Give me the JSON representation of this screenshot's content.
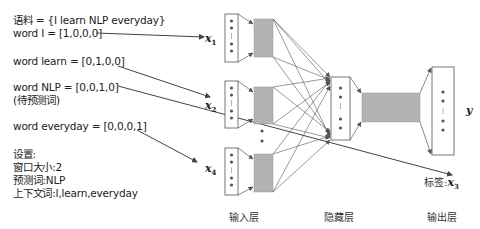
{
  "left_text": {
    "corpus": "语料 = {I learn NLP everyday}",
    "word_i": "word I = [1,0,0,0]",
    "word_learn": "word learn = [0,1,0,0]",
    "word_nlp": "word NLP = [0,0,1,0]",
    "word_nlp_note": "(待预测词)",
    "word_everyday": "word everyday = [0,0,0,1]",
    "settings_title": "设置:",
    "window_size": "窗口大小:2",
    "target_word": "预测词:NLP",
    "context_words": "上下文词:I,learn,everyday"
  },
  "variables": {
    "x1": {
      "base": "x",
      "sub": "1"
    },
    "x2": {
      "base": "x",
      "sub": "2"
    },
    "x4": {
      "base": "x",
      "sub": "4"
    },
    "y": "y",
    "label_prefix": "标签:",
    "x3": {
      "base": "x",
      "sub": "3"
    }
  },
  "layer_labels": {
    "input": "输入层",
    "hidden": "隐藏层",
    "output": "输出层"
  },
  "colors": {
    "line": "#444444",
    "box_border": "#555555",
    "gray_fill": "#b3b3b3",
    "dot": "#555555"
  }
}
